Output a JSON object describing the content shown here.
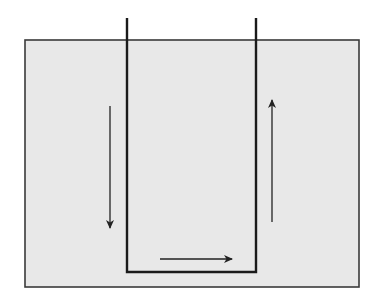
{
  "diagram": {
    "title": "",
    "colors": {
      "background": "#ffffff",
      "container_fill": "#e8e8e8",
      "container_stroke": "#3a3a3a",
      "tube_stroke": "#1a1a1a",
      "arrow_stroke": "#222222"
    },
    "container": {
      "x": 25,
      "y": 40,
      "width": 334,
      "height": 247
    },
    "tube": {
      "left_x": 127,
      "right_x": 256,
      "top_y": 18,
      "bottom_y": 272
    },
    "arrows": [
      {
        "name": "down-arrow-left",
        "direction": "down",
        "x1": 110,
        "y1": 106,
        "x2": 110,
        "y2": 228
      },
      {
        "name": "right-arrow-bottom",
        "direction": "right",
        "x1": 160,
        "y1": 259,
        "x2": 232,
        "y2": 259
      },
      {
        "name": "up-arrow-right",
        "direction": "up",
        "x1": 272,
        "y1": 222,
        "x2": 272,
        "y2": 100
      }
    ],
    "labels": []
  }
}
